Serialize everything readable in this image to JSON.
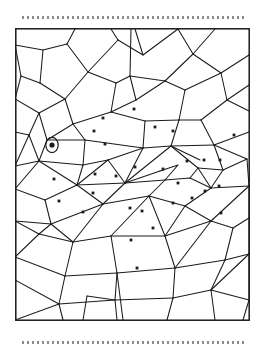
{
  "page": {
    "background_color": "#ffffff",
    "width": 266,
    "height": 354
  },
  "decorations": {
    "top_rule": {
      "name": "dotted-separator-top",
      "style": "dotted",
      "color": "#8a8a8a"
    },
    "bottom_rule": {
      "name": "dotted-separator-bottom",
      "style": "dotted",
      "color": "#8a8a8a"
    }
  },
  "puzzle": {
    "name": "mosaic-hidden-fish",
    "subject": "fish",
    "line_color": "#1b1b1b",
    "fill_color": "#ffffff",
    "frame": {
      "x": 0.8,
      "y": 0.8,
      "width": 233.4,
      "height": 291.4
    },
    "marked_cell_count": 34,
    "eye": {
      "cx": 37,
      "cy": 117,
      "rx": 6.2,
      "ry": 7.6,
      "pupil_r": 2.6
    },
    "dots": [
      {
        "cx": 119,
        "cy": 81
      },
      {
        "cx": 88,
        "cy": 90
      },
      {
        "cx": 79,
        "cy": 103
      },
      {
        "cx": 90,
        "cy": 116
      },
      {
        "cx": 140,
        "cy": 99
      },
      {
        "cx": 158,
        "cy": 103
      },
      {
        "cx": 219,
        "cy": 107
      },
      {
        "cx": 172,
        "cy": 133
      },
      {
        "cx": 189,
        "cy": 132
      },
      {
        "cx": 205,
        "cy": 132
      },
      {
        "cx": 148,
        "cy": 141
      },
      {
        "cx": 120,
        "cy": 139
      },
      {
        "cx": 101,
        "cy": 148
      },
      {
        "cx": 80,
        "cy": 146
      },
      {
        "cx": 39,
        "cy": 151
      },
      {
        "cx": 78,
        "cy": 165
      },
      {
        "cx": 163,
        "cy": 155
      },
      {
        "cx": 177,
        "cy": 170
      },
      {
        "cx": 158,
        "cy": 175
      },
      {
        "cx": 190,
        "cy": 163
      },
      {
        "cx": 44,
        "cy": 173
      },
      {
        "cx": 68,
        "cy": 184
      },
      {
        "cx": 127,
        "cy": 183
      },
      {
        "cx": 115,
        "cy": 180
      },
      {
        "cx": 206,
        "cy": 185
      },
      {
        "cx": 138,
        "cy": 200
      },
      {
        "cx": 116,
        "cy": 212
      },
      {
        "cx": 204,
        "cy": 158
      },
      {
        "cx": 122,
        "cy": 240
      }
    ]
  }
}
